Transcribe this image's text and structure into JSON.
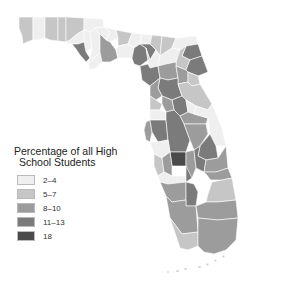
{
  "legend": {
    "title_line1": "Percentage of all High",
    "title_line2": "School Students",
    "items": [
      {
        "label": "2–4",
        "color": "#efefef"
      },
      {
        "label": "5–7",
        "color": "#c6c6c6"
      },
      {
        "label": "8–10",
        "color": "#9c9c9c"
      },
      {
        "label": "11–13",
        "color": "#7b7b7b"
      },
      {
        "label": "18",
        "color": "#4a4a4a"
      }
    ]
  },
  "map": {
    "region": "Florida",
    "unit": "county",
    "class_colors": {
      "c1": "#efefef",
      "c2": "#c6c6c6",
      "c3": "#9c9c9c",
      "c4": "#7b7b7b",
      "c5": "#4a4a4a"
    }
  }
}
